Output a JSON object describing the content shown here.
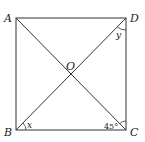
{
  "diagram": {
    "type": "square-with-diagonals",
    "stroke_color": "#333333",
    "points": {
      "A": {
        "label": "A",
        "x": 16,
        "y": 18
      },
      "D": {
        "label": "D",
        "x": 126,
        "y": 18
      },
      "B": {
        "label": "B",
        "x": 16,
        "y": 130
      },
      "C": {
        "label": "C",
        "x": 126,
        "y": 130
      },
      "O": {
        "label": "O",
        "x": 71,
        "y": 74
      }
    },
    "angles": {
      "x": {
        "label": "x",
        "vertex": "B"
      },
      "y": {
        "label": "y",
        "vertex": "D"
      },
      "c": {
        "label": "45°",
        "vertex": "C"
      }
    }
  }
}
